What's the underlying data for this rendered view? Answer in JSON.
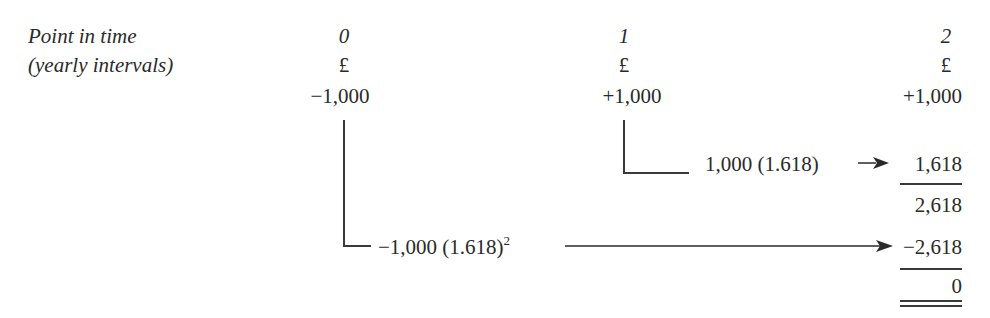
{
  "labels": {
    "row_label_1": "Point in time",
    "row_label_2": "(yearly intervals)"
  },
  "columns": [
    {
      "time": "0",
      "currency": "£",
      "cash_flow": "−1,000"
    },
    {
      "time": "1",
      "currency": "£",
      "cash_flow": "+1,000"
    },
    {
      "time": "2",
      "currency": "£",
      "cash_flow": "+1,000"
    }
  ],
  "compounding": {
    "year1_expr": "1,000 (1.618)",
    "year0_expr_base": "−1,000 (1.618)",
    "year0_expr_exponent": "2"
  },
  "summation": {
    "compounded_year1": "1,618",
    "subtotal": "2,618",
    "compounded_year0": "−2,618",
    "total": "0"
  },
  "colors": {
    "ink": "#2a2a2a",
    "background": "#ffffff"
  }
}
